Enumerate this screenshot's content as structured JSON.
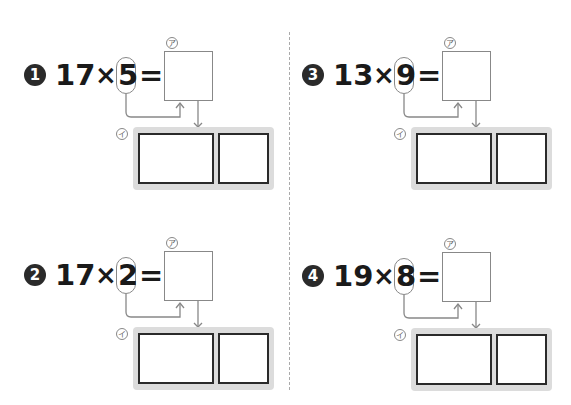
{
  "worksheet": {
    "labels": {
      "a": "ア",
      "i": "イ"
    },
    "problems": [
      {
        "badge": "1",
        "multiplicand": "17",
        "times": "×",
        "multiplier": "5",
        "equals": "="
      },
      {
        "badge": "2",
        "multiplicand": "17",
        "times": "×",
        "multiplier": "2",
        "equals": "="
      },
      {
        "badge": "3",
        "multiplicand": "13",
        "times": "×",
        "multiplier": "9",
        "equals": "="
      },
      {
        "badge": "4",
        "multiplicand": "19",
        "times": "×",
        "multiplier": "8",
        "equals": "="
      }
    ]
  }
}
